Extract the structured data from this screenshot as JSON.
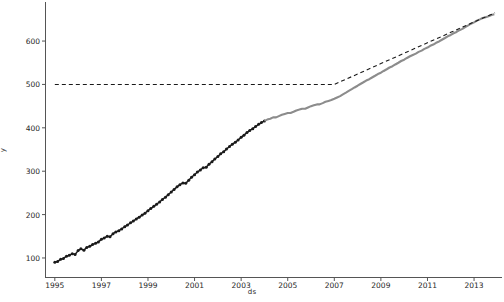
{
  "chart_data": {
    "type": "line",
    "title": "",
    "xlabel": "ds",
    "ylabel": "y",
    "grid": false,
    "legend": "none",
    "xlim": [
      1994.6,
      2014.2
    ],
    "ylim": [
      55,
      690
    ],
    "xticks": [
      "1995",
      "1997",
      "1999",
      "2001",
      "2003",
      "2005",
      "2007",
      "2009",
      "2011",
      "2013"
    ],
    "xtick_values": [
      1995,
      1997,
      1999,
      2001,
      2003,
      2005,
      2007,
      2009,
      2011,
      2013
    ],
    "yticks": [
      "100",
      "200",
      "300",
      "400",
      "500",
      "600"
    ],
    "ytick_values": [
      100,
      200,
      300,
      400,
      500,
      600
    ],
    "series": [
      {
        "name": "observed",
        "style": "line-markers",
        "color": "#1a1a1a",
        "x": [
          1995.0,
          1995.12,
          1995.25,
          1995.37,
          1995.5,
          1995.62,
          1995.75,
          1995.87,
          1996.0,
          1996.12,
          1996.25,
          1996.37,
          1996.5,
          1996.62,
          1996.75,
          1996.87,
          1997.0,
          1997.12,
          1997.25,
          1997.37,
          1997.5,
          1997.62,
          1997.75,
          1997.87,
          1998.0,
          1998.12,
          1998.25,
          1998.37,
          1998.5,
          1998.62,
          1998.75,
          1998.87,
          1999.0,
          1999.12,
          1999.25,
          1999.37,
          1999.5,
          1999.62,
          1999.75,
          1999.87,
          2000.0,
          2000.12,
          2000.25,
          2000.37,
          2000.5,
          2000.62,
          2000.75,
          2000.87,
          2001.0,
          2001.12,
          2001.25,
          2001.37,
          2001.5,
          2001.62,
          2001.75,
          2001.87,
          2002.0,
          2002.12,
          2002.25,
          2002.37,
          2002.5,
          2002.62,
          2002.75,
          2002.87,
          2003.0,
          2003.12,
          2003.25,
          2003.37,
          2003.5,
          2003.62,
          2003.75,
          2003.87,
          2004.0
        ],
        "y": [
          90,
          92,
          97,
          99,
          104,
          106,
          110,
          108,
          117,
          121,
          118,
          124,
          127,
          131,
          134,
          137,
          143,
          146,
          150,
          149,
          156,
          160,
          163,
          167,
          172,
          176,
          181,
          185,
          190,
          194,
          199,
          203,
          209,
          214,
          219,
          224,
          229,
          235,
          240,
          246,
          252,
          258,
          264,
          269,
          273,
          272,
          279,
          286,
          292,
          298,
          303,
          308,
          309,
          316,
          322,
          328,
          334,
          340,
          345,
          351,
          357,
          362,
          367,
          372,
          378,
          383,
          389,
          394,
          398,
          403,
          408,
          412,
          416
        ]
      },
      {
        "name": "actual",
        "style": "line",
        "color": "#8c8c8c",
        "x": [
          2004.0,
          2004.12,
          2004.25,
          2004.37,
          2004.5,
          2004.62,
          2004.75,
          2004.87,
          2005.0,
          2005.12,
          2005.25,
          2005.37,
          2005.5,
          2005.62,
          2005.75,
          2005.87,
          2006.0,
          2006.12,
          2006.25,
          2006.37,
          2006.5,
          2006.62,
          2006.75,
          2006.87,
          2007.0,
          2007.12,
          2007.25,
          2007.37,
          2007.5,
          2007.62,
          2007.75,
          2007.87,
          2008.0,
          2008.12,
          2008.25,
          2008.37,
          2008.5,
          2008.62,
          2008.75,
          2008.87,
          2009.0,
          2009.12,
          2009.25,
          2009.37,
          2009.5,
          2009.62,
          2009.75,
          2009.87,
          2010.0,
          2010.12,
          2010.25,
          2010.37,
          2010.5,
          2010.62,
          2010.75,
          2010.87,
          2011.0,
          2011.12,
          2011.25,
          2011.37,
          2011.5,
          2011.62,
          2011.75,
          2011.87,
          2012.0,
          2012.12,
          2012.25,
          2012.37,
          2012.5,
          2012.62,
          2012.75,
          2012.87,
          2013.0,
          2013.12,
          2013.25,
          2013.37,
          2013.5,
          2013.62,
          2013.75,
          2013.87
        ],
        "y": [
          416,
          419,
          421,
          424,
          424,
          427,
          430,
          432,
          434,
          434,
          437,
          440,
          442,
          444,
          444,
          447,
          450,
          452,
          454,
          454,
          457,
          460,
          462,
          464,
          467,
          470,
          473,
          477,
          481,
          485,
          489,
          493,
          497,
          501,
          505,
          509,
          512,
          516,
          520,
          524,
          527,
          531,
          535,
          539,
          542,
          546,
          550,
          554,
          557,
          561,
          565,
          568,
          571,
          575,
          578,
          582,
          585,
          589,
          592,
          596,
          599,
          603,
          607,
          611,
          614,
          618,
          621,
          625,
          628,
          632,
          636,
          640,
          643,
          647,
          650,
          653,
          655,
          657,
          660,
          662
        ]
      },
      {
        "name": "forecast",
        "style": "dashed",
        "color": "#1a1a1a",
        "x": [
          1995.0,
          2007.0,
          2008.0,
          2009.0,
          2010.0,
          2011.0,
          2012.0,
          2013.0,
          2013.9
        ],
        "y": [
          500,
          500,
          524,
          548,
          572,
          596,
          620,
          644,
          665
        ]
      }
    ]
  },
  "axis": {
    "x_label": "ds",
    "y_label": "y"
  }
}
